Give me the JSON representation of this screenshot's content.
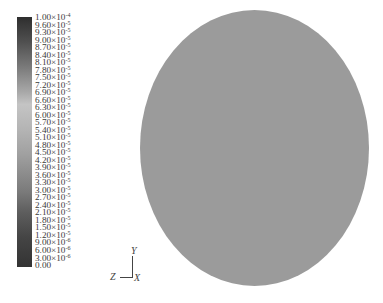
{
  "chart_data": {
    "type": "heatmap",
    "title": "",
    "plot_shape": "circle",
    "field_uniform_value_color": "#9b9b9b",
    "colorbar": {
      "min": 0.0,
      "max": 0.0001,
      "step": 3e-06,
      "colors_top_to_bottom": [
        "#2e2e2e",
        "#7a7a7a",
        "#c4c4c4",
        "#a0a0a0",
        "#7a7a7a",
        "#333333"
      ],
      "tick_labels": [
        "1.00×10⁻⁴",
        "9.60×10⁻⁵",
        "9.30×10⁻⁵",
        "9.00×10⁻⁵",
        "8.70×10⁻⁵",
        "8.40×10⁻⁵",
        "8.10×10⁻⁵",
        "7.80×10⁻⁵",
        "7.50×10⁻⁵",
        "7.20×10⁻⁵",
        "6.90×10⁻⁵",
        "6.60×10⁻⁵",
        "6.30×10⁻⁵",
        "6.00×10⁻⁵",
        "5.70×10⁻⁵",
        "5.40×10⁻⁵",
        "5.10×10⁻⁵",
        "4.80×10⁻⁵",
        "4.50×10⁻⁵",
        "4.20×10⁻⁵",
        "3.90×10⁻⁵",
        "3.60×10⁻⁵",
        "3.30×10⁻⁵",
        "3.00×10⁻⁵",
        "2.70×10⁻⁵",
        "2.40×10⁻⁵",
        "2.10×10⁻⁵",
        "1.80×10⁻⁵",
        "1.50×10⁻⁵",
        "1.20×10⁻⁵",
        "9.00×10⁻⁶",
        "6.00×10⁻⁶",
        "3.00×10⁻⁶",
        "0.00"
      ]
    },
    "axes_triad": {
      "x": "X",
      "y": "Y",
      "z": "Z"
    },
    "legend_position": "left",
    "grid": false
  },
  "legend": {
    "labels": [
      {
        "m": "1.00×10",
        "e": "-4"
      },
      {
        "m": "9.60×10",
        "e": "-5"
      },
      {
        "m": "9.30×10",
        "e": "-5"
      },
      {
        "m": "9.00×10",
        "e": "-5"
      },
      {
        "m": "8.70×10",
        "e": "-5"
      },
      {
        "m": "8.40×10",
        "e": "-5"
      },
      {
        "m": "8.10×10",
        "e": "-5"
      },
      {
        "m": "7.80×10",
        "e": "-5"
      },
      {
        "m": "7.50×10",
        "e": "-5"
      },
      {
        "m": "7.20×10",
        "e": "-5"
      },
      {
        "m": "6.90×10",
        "e": "-5"
      },
      {
        "m": "6.60×10",
        "e": "-5"
      },
      {
        "m": "6.30×10",
        "e": "-5"
      },
      {
        "m": "6.00×10",
        "e": "-5"
      },
      {
        "m": "5.70×10",
        "e": "-5"
      },
      {
        "m": "5.40×10",
        "e": "-5"
      },
      {
        "m": "5.10×10",
        "e": "-5"
      },
      {
        "m": "4.80×10",
        "e": "-5"
      },
      {
        "m": "4.50×10",
        "e": "-5"
      },
      {
        "m": "4.20×10",
        "e": "-5"
      },
      {
        "m": "3.90×10",
        "e": "-5"
      },
      {
        "m": "3.60×10",
        "e": "-5"
      },
      {
        "m": "3.30×10",
        "e": "-5"
      },
      {
        "m": "3.00×10",
        "e": "-5"
      },
      {
        "m": "2.70×10",
        "e": "-5"
      },
      {
        "m": "2.40×10",
        "e": "-5"
      },
      {
        "m": "2.10×10",
        "e": "-5"
      },
      {
        "m": "1.80×10",
        "e": "-5"
      },
      {
        "m": "1.50×10",
        "e": "-5"
      },
      {
        "m": "1.20×10",
        "e": "-5"
      },
      {
        "m": "9.00×10",
        "e": "-6"
      },
      {
        "m": "6.00×10",
        "e": "-6"
      },
      {
        "m": "3.00×10",
        "e": "-6"
      },
      {
        "m": "0.00",
        "e": ""
      }
    ]
  },
  "axes": {
    "x_label": "X",
    "y_label": "Y",
    "z_label": "Z"
  }
}
